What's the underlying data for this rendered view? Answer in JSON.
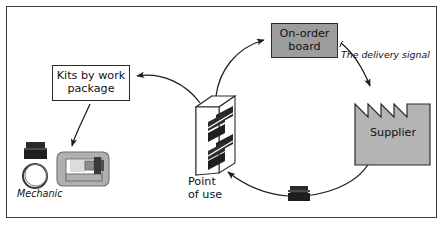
{
  "figure": {
    "type": "supply-chain-cycle-diagram",
    "border_color": "#3a3a3a",
    "background": "#ffffff"
  },
  "nodes": {
    "on_order_board": {
      "label": "On-order\nboard",
      "fill": "#9d9d9d",
      "stroke": "#2b2b2b"
    },
    "kits_by_work_package": {
      "label": "Kits by work\npackage",
      "fill": "#ffffff",
      "stroke": "#2b2b2b"
    },
    "supplier": {
      "label": "Supplier",
      "fill": "#b4b4b4",
      "stroke": "#2b2b2b",
      "shape": "factory-sawtooth-roof"
    },
    "point_of_use": {
      "label": "Point\nof use",
      "shape": "isometric-shelving-rack",
      "fill": "#ffffff",
      "stroke": "#2b2b2b"
    },
    "mechanic": {
      "label": "Mechanic",
      "shape": "machine-with-tire-and-crate",
      "fill": "#b0b0b0",
      "stroke": "#4a4a4a"
    }
  },
  "annotations": {
    "delivery_signal": "The delivery signal"
  },
  "bins": {
    "transit_bin_label": "parts-crate",
    "mechanic_bin_label": "parts-crate",
    "rack_bin_color": "#2a2a2a"
  },
  "flow": [
    {
      "from": "point_of_use",
      "to": "on_order_board"
    },
    {
      "from": "on_order_board",
      "to": "supplier"
    },
    {
      "from": "supplier",
      "to": "point_of_use"
    },
    {
      "from": "point_of_use",
      "to": "kits_by_work_package"
    },
    {
      "from": "kits_by_work_package",
      "to": "mechanic"
    }
  ]
}
